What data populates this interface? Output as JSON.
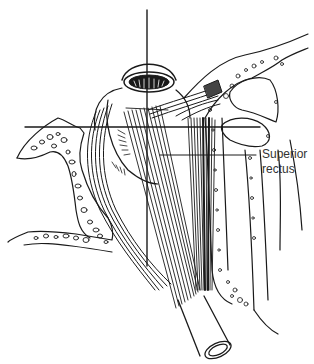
{
  "figure": {
    "label": {
      "line1": "Superior",
      "line2": "rectus"
    },
    "colors": {
      "background": "#ffffff",
      "line": "#1a1a1a",
      "label_text": "#333333"
    }
  }
}
